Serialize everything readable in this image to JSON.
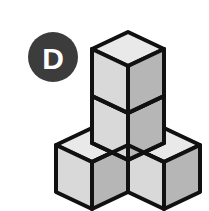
{
  "page": {
    "background_color": "#ffffff",
    "width": 209,
    "height": 211,
    "kind": "isometric-cube-puzzle-figure"
  },
  "badge": {
    "label": "D",
    "shape": "circle",
    "fill_color": "#3c3c3c",
    "text_color": "#ffffff",
    "center_x": 53,
    "center_y": 57,
    "radius": 25
  },
  "figure": {
    "name": "cube-stack",
    "cube_count": 4,
    "arrangement": "Two cubes stacked vertically at the back-center position, with one cube attached at the bottom-left-front and one cube at the bottom-right-front, forming a T / tripod shape.",
    "projection": "isometric",
    "unit": {
      "half_width": 36,
      "half_depth_rise": 17,
      "vertical_edge": 47
    },
    "colors": {
      "top_face": "#e9e9e9",
      "left_face": "#d9d9d9",
      "right_face": "#b6b6b6",
      "outline": "#111111"
    },
    "stroke_width": 4,
    "cubes": [
      {
        "name": "top-back-cube",
        "origin_x": 128,
        "origin_y": 32,
        "visible_faces": [
          "top",
          "left",
          "right"
        ]
      },
      {
        "name": "middle-back-cube",
        "origin_x": 128,
        "origin_y": 79,
        "visible_faces": [
          "left",
          "right"
        ]
      },
      {
        "name": "bottom-left-cube",
        "origin_x": 92,
        "origin_y": 128,
        "visible_faces": [
          "top",
          "left",
          "right"
        ]
      },
      {
        "name": "bottom-right-cube",
        "origin_x": 164,
        "origin_y": 128,
        "visible_faces": [
          "top",
          "left",
          "right"
        ]
      }
    ]
  }
}
